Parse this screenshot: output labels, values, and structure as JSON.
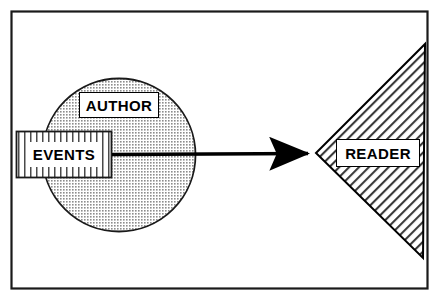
{
  "diagram": {
    "type": "communication-model-diagram",
    "title": "",
    "background_color": "#FFFFFF",
    "frame": {
      "name": "outer-frame",
      "stroke_color": "#000000",
      "fill_color": "#FFFFFF",
      "x": 11,
      "y": 11,
      "width": 417,
      "height": 278
    },
    "nodes": [
      {
        "id": "author",
        "label": "AUTHOR",
        "shape": "circle",
        "fill_pattern": "dotted-stipple",
        "fill_color": "#C8C8C8",
        "stroke_color": "#000000",
        "cx": 119,
        "cy": 155,
        "r": 77
      },
      {
        "id": "events",
        "label": "EVENTS",
        "shape": "rectangle",
        "fill_pattern": "vertical-stripes",
        "fill_color": "#E8E8E8",
        "stroke_color": "#000000",
        "x": 16,
        "y": 131,
        "width": 96,
        "height": 47
      },
      {
        "id": "reader",
        "label": "READER",
        "shape": "triangle",
        "fill_pattern": "diagonal-hatch",
        "fill_color": "#FFFFFF",
        "stroke_color": "#000000",
        "apex_x": 316,
        "apex_y": 153,
        "top_x": 425,
        "top_y": 44,
        "bottom_x": 423,
        "bottom_y": 258
      }
    ],
    "connectors": [
      {
        "id": "events-to-reader",
        "from": "events",
        "to": "reader",
        "style": "solid-arrow",
        "stroke_color": "#000000",
        "x1": 112,
        "y1": 154,
        "x2": 316,
        "y2": 153
      }
    ]
  }
}
